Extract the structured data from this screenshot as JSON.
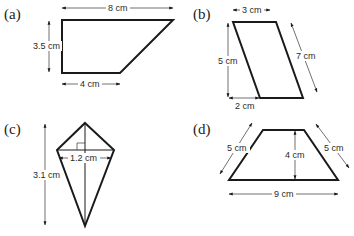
{
  "figures": [
    {
      "id": "a",
      "label": "(a)",
      "shape": "right trapezoid",
      "measurements": {
        "top": "8 cm",
        "height": "3.5 cm",
        "bottom": "4 cm"
      }
    },
    {
      "id": "b",
      "label": "(b)",
      "shape": "parallelogram",
      "measurements": {
        "top": "3 cm",
        "height": "5 cm",
        "slant_side": "7 cm",
        "offset": "2 cm"
      }
    },
    {
      "id": "c",
      "label": "(c)",
      "shape": "kite",
      "measurements": {
        "long_diagonal": "3.1 cm",
        "short_diagonal": "1.2 cm"
      }
    },
    {
      "id": "d",
      "label": "(d)",
      "shape": "isosceles trapezoid",
      "measurements": {
        "left_side": "5 cm",
        "right_side": "5 cm",
        "height": "4 cm",
        "bottom": "9 cm"
      }
    }
  ],
  "colors": {
    "line": "#1a1a1a",
    "background": "#ffffff"
  }
}
